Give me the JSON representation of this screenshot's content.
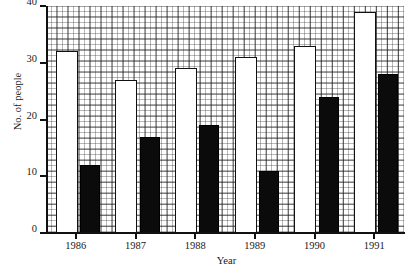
{
  "chart_data": {
    "type": "bar",
    "title": "",
    "subtitle": "",
    "xlabel": "Year",
    "ylabel": "No. of people",
    "categories": [
      "1986",
      "1987",
      "1988",
      "1989",
      "1990",
      "1991"
    ],
    "series": [
      {
        "name": "white-bars",
        "color": "#ffffff",
        "values": [
          32,
          27,
          29,
          31,
          33,
          39
        ]
      },
      {
        "name": "black-bars",
        "color": "#0b0b0b",
        "values": [
          12,
          17,
          19,
          11,
          24,
          28
        ]
      }
    ],
    "ylim": [
      0,
      40
    ],
    "yticks": [
      0,
      10,
      20,
      30,
      40
    ],
    "ytick_labels": [
      "0",
      "10",
      "20",
      "30",
      "40"
    ],
    "xtick_labels": [
      "1986",
      "1987",
      "1988",
      "1989",
      "1990",
      "1991"
    ],
    "grid": true,
    "grid_style": "graph-paper minor 1 unit, major every 2 units",
    "legend": "none",
    "legend_position": "none"
  }
}
